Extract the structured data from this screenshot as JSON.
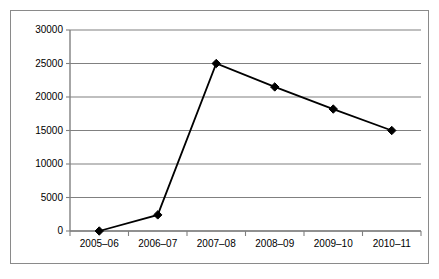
{
  "chart_data": {
    "type": "line",
    "title": "",
    "subtitle": "",
    "xlabel": "",
    "ylabel": "",
    "categories": [
      "2005–06",
      "2006–07",
      "2007–08",
      "2008–09",
      "2009–10",
      "2010–11"
    ],
    "values": [
      0,
      2400,
      25000,
      21500,
      18200,
      15000
    ],
    "series": [
      {
        "name": "Series 1",
        "values": [
          0,
          2400,
          25000,
          21500,
          18200,
          15000
        ]
      }
    ],
    "ylim": [
      0,
      30000
    ],
    "ytick_labels": [
      "0",
      "5000",
      "10000",
      "15000",
      "20000",
      "25000",
      "30000"
    ],
    "ytick_values": [
      0,
      5000,
      10000,
      15000,
      20000,
      25000,
      30000
    ],
    "grid": true,
    "grid_axis": "y",
    "legend": false,
    "legend_position": "none",
    "marker": "diamond",
    "marker_color": "#000000",
    "line_color": "#000000",
    "grid_color": "#808080",
    "axis_color": "#808080",
    "border_color": "#8a8a8a",
    "plot_background": "#ffffff",
    "annotations": []
  },
  "axes": {
    "y_labels": [
      {
        "text": "30000",
        "value": 30000
      },
      {
        "text": "25000",
        "value": 25000
      },
      {
        "text": "20000",
        "value": 20000
      },
      {
        "text": "15000",
        "value": 15000
      },
      {
        "text": "10000",
        "value": 10000
      },
      {
        "text": "5000",
        "value": 5000
      },
      {
        "text": "0",
        "value": 0
      }
    ],
    "x_labels": [
      {
        "text": "2005–06"
      },
      {
        "text": "2006–07"
      },
      {
        "text": "2007–08"
      },
      {
        "text": "2008–09"
      },
      {
        "text": "2009–10"
      },
      {
        "text": "2010–11"
      }
    ]
  }
}
